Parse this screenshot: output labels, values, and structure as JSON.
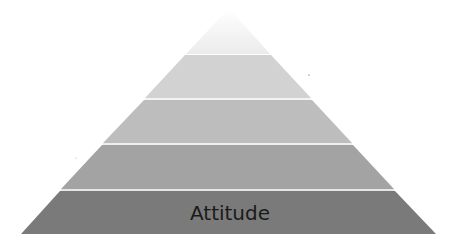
{
  "diagram": {
    "type": "pyramid",
    "tiers": [
      {
        "label": "",
        "color": "#f6f6f6"
      },
      {
        "label": "",
        "color": "#d2d2d2"
      },
      {
        "label": "",
        "color": "#bdbdbd"
      },
      {
        "label": "",
        "color": "#a3a3a3"
      },
      {
        "label": "Attitude",
        "color": "#7a7a7a"
      }
    ],
    "separator_color": "#ececec"
  }
}
